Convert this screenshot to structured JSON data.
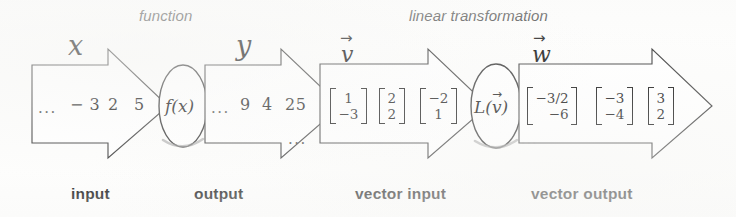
{
  "figure": {
    "headings": {
      "function": "function",
      "linear_transformation": "linear transformation"
    },
    "captions": {
      "input": "input",
      "output": "output",
      "vector_input": "vector input",
      "vector_output": "vector output"
    },
    "variables": {
      "x": "x",
      "y": "y",
      "v": "v",
      "w": "w"
    },
    "processors": {
      "scalar_function": "f(x)",
      "vector_function_prefix": "L(",
      "vector_function_arg": "v",
      "vector_function_suffix": ")"
    },
    "scalar_input": {
      "leading_dots": "...",
      "values": [
        "− 3",
        "2",
        "5"
      ]
    },
    "scalar_output": {
      "leading_dots": "...",
      "values": [
        "9",
        "4",
        "25"
      ],
      "trailing_dots": "..."
    },
    "vector_input": {
      "vectors": [
        {
          "top": "1",
          "bottom": "−3"
        },
        {
          "top": "2",
          "bottom": "2"
        },
        {
          "top": "−2",
          "bottom": "1"
        }
      ]
    },
    "vector_output": {
      "leading_dots": "...",
      "vectors": [
        {
          "top": "−3/2",
          "bottom": "−6"
        },
        {
          "top": "−3",
          "bottom": "−4"
        },
        {
          "top": "3",
          "bottom": "2"
        }
      ]
    },
    "colors": {
      "stroke": "#3c3c3c",
      "ink": "#1a1a1a",
      "background": "#fdfdfc"
    }
  }
}
